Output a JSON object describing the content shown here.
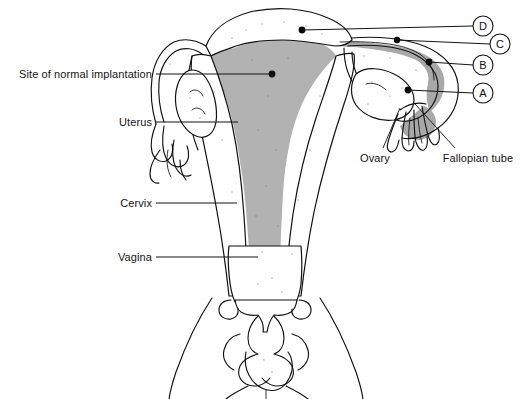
{
  "figure": {
    "type": "anatomical-line-diagram",
    "background_color": "#ffffff",
    "ink_color": "#111111",
    "shade_color": "#b2b2b2",
    "marker_color": "#0a0a0a"
  },
  "left_labels": [
    {
      "key": "implantation",
      "text": "Site of normal implantation",
      "text_x": 152,
      "text_y": 78,
      "line_x1": 156,
      "line_x2": 272,
      "line_y": 74
    },
    {
      "key": "uterus",
      "text": "Uterus",
      "text_x": 152,
      "text_y": 126,
      "line_x1": 156,
      "line_x2": 238,
      "line_y": 122
    },
    {
      "key": "cervix",
      "text": "Cervix",
      "text_x": 152,
      "text_y": 207,
      "line_x1": 156,
      "line_x2": 237,
      "line_y": 203
    },
    {
      "key": "vagina",
      "text": "Vagina",
      "text_x": 152,
      "text_y": 261,
      "line_x1": 156,
      "line_x2": 258,
      "line_y": 257
    }
  ],
  "right_labels": [
    {
      "key": "ovary",
      "text": "Ovary",
      "text_x": 375,
      "text_y": 162,
      "line_x1": 383,
      "line_y1": 148,
      "line_x2": 400,
      "line_y2": 108
    },
    {
      "key": "fallopian-tube",
      "text": "Fallopian tube",
      "text_x": 478,
      "text_y": 162,
      "line_x1": 455,
      "line_y1": 148,
      "line_x2": 415,
      "line_y2": 104
    }
  ],
  "letter_markers": [
    {
      "letter": "D",
      "cx": 483,
      "cy": 26,
      "r": 10,
      "line_x1": 473,
      "line_y1": 26,
      "line_x2": 302,
      "line_y2": 30
    },
    {
      "letter": "C",
      "cx": 500,
      "cy": 44,
      "r": 10,
      "line_x1": 490,
      "line_y1": 44,
      "line_x2": 397,
      "line_y2": 40
    },
    {
      "letter": "B",
      "cx": 483,
      "cy": 65,
      "r": 10,
      "line_x1": 473,
      "line_y1": 65,
      "line_x2": 429,
      "line_y2": 62
    },
    {
      "letter": "A",
      "cx": 483,
      "cy": 93,
      "r": 10,
      "line_x1": 473,
      "line_y1": 93,
      "line_x2": 408,
      "line_y2": 90
    }
  ],
  "implantation_dots": [
    {
      "key": "fundus-dot",
      "cx": 302,
      "cy": 30,
      "r": 3.4
    },
    {
      "key": "uterine-cavity-dot",
      "cx": 272,
      "cy": 74,
      "r": 3.4
    },
    {
      "key": "tube-interstitial-dot",
      "cx": 397,
      "cy": 40,
      "r": 3.2
    },
    {
      "key": "tube-ampulla-dot",
      "cx": 429,
      "cy": 62,
      "r": 3.4
    },
    {
      "key": "fimbrial-dot",
      "cx": 408,
      "cy": 90,
      "r": 3.4
    }
  ],
  "footer": {
    "text": ""
  }
}
